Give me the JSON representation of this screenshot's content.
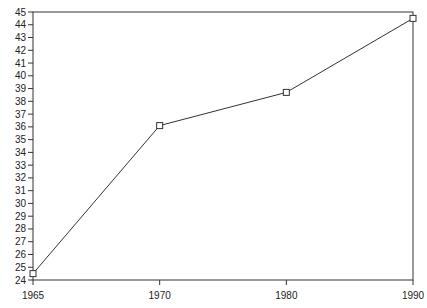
{
  "chart_data": {
    "type": "line",
    "title": "",
    "xlabel": "",
    "ylabel": "",
    "categories": [
      "1965",
      "1970",
      "1980",
      "1990"
    ],
    "series": [
      {
        "name": "series-1",
        "values": [
          24.5,
          36.1,
          38.7,
          44.5
        ],
        "color": "#333333",
        "marker": "square"
      }
    ],
    "ylim": [
      24,
      45
    ],
    "yticks": [
      24,
      25,
      26,
      27,
      28,
      29,
      30,
      31,
      32,
      33,
      34,
      35,
      36,
      37,
      38,
      39,
      40,
      41,
      42,
      43,
      44,
      45
    ],
    "grid": false,
    "legend": null
  },
  "colors": {
    "axis": "#333333",
    "line": "#444444",
    "text": "#222222",
    "background": "#ffffff"
  }
}
